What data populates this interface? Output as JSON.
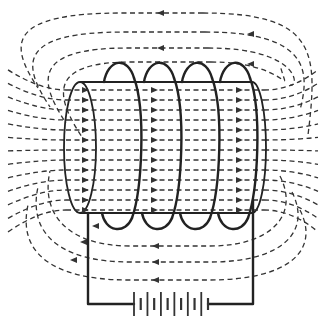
{
  "diagram": {
    "components": {
      "coil": {
        "label": "",
        "turns": 4
      },
      "core": {
        "label": "",
        "shape": "cylinder"
      },
      "battery": {
        "label": "",
        "cells": 6
      },
      "field_lines": {
        "style": "dashed-with-arrows",
        "inside_direction": "left-to-right",
        "outside_direction": "right-to-left",
        "outer_loops_top": 4,
        "outer_loops_bottom": 3,
        "interior_lines": 13
      }
    },
    "colors": {
      "line": "#222222",
      "field": "#333333",
      "background": "#ffffff"
    },
    "labels": []
  }
}
